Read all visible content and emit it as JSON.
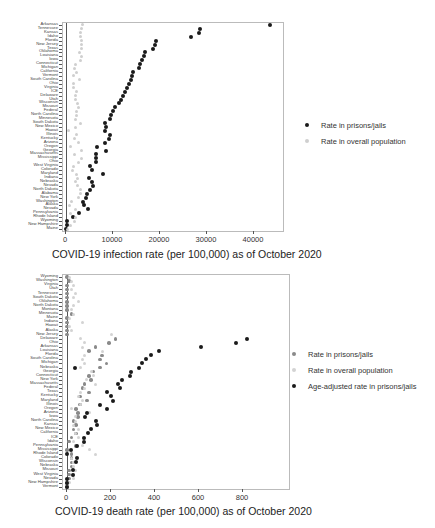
{
  "chart_data": [
    {
      "type": "scatter",
      "title": "",
      "xlabel": "COVID-19 infection rate (per 100,000) as of October 2020",
      "ylabel": "",
      "xlim": [
        0,
        45000
      ],
      "xticks": [
        0,
        10000,
        20000,
        30000,
        40000
      ],
      "grid": false,
      "legend_position": "right",
      "legend": [
        "Rate in prisons/jails",
        "Rate in overall population"
      ],
      "categories": [
        "Arkansas",
        "Tennessee",
        "Kansas",
        "Idaho",
        "Florida",
        "New Jersey",
        "Texas",
        "Oklahoma",
        "Louisiana",
        "Iowa",
        "Connecticut",
        "Michigan",
        "California",
        "Vermont",
        "South Carolina",
        "Ohio",
        "Virginia",
        "ICE",
        "Delaware",
        "Utah",
        "Wisconsin",
        "Missouri",
        "Federal",
        "North Carolina",
        "Minnesota",
        "South Dakota",
        "New Mexico",
        "Hawaii",
        "Illinois",
        "Kentucky",
        "Arizona",
        "Oregon",
        "Georgia",
        "Massachusetts",
        "Mississippi",
        "Ohio",
        "West Virginia",
        "Colorado",
        "Maryland",
        "Indiana",
        "Nebraska",
        "Nevada",
        "North Dakota",
        "Alabama",
        "New York",
        "Washington",
        "Alaska",
        "Nevada",
        "Pennsylvania",
        "Rhode Island",
        "Wyoming",
        "New Hampshire",
        "Maine"
      ],
      "series": [
        {
          "name": "Rate in prisons/jails",
          "color": "#1a1a1a",
          "values": [
            43500,
            28500,
            28300,
            26500,
            19100,
            19000,
            18500,
            16800,
            16500,
            16200,
            15800,
            15500,
            14300,
            14000,
            13800,
            13300,
            13000,
            12600,
            12200,
            11800,
            11300,
            10400,
            10100,
            9600,
            9300,
            8200,
            8600,
            8300,
            9400,
            9100,
            8400,
            6700,
            8500,
            6400,
            6300,
            6400,
            5000,
            5600,
            7800,
            4900,
            5500,
            5800,
            5200,
            4500,
            4300,
            3700,
            3800,
            4600,
            2800,
            1400,
            200,
            200,
            100
          ]
        },
        {
          "name": "Rate in overall population",
          "color": "#cfcfcf",
          "values": [
            3600,
            3400,
            3000,
            3100,
            3400,
            3200,
            3300,
            2800,
            3300,
            3000,
            2000,
            1800,
            2200,
            1500,
            2900,
            1500,
            1500,
            2300,
            2100,
            2100,
            2500,
            2600,
            2200,
            2300,
            2000,
            3000,
            2000,
            500,
            2300,
            1800,
            2700,
            1000,
            3200,
            1900,
            3300,
            2700,
            1700,
            1400,
            2200,
            2400,
            2000,
            2400,
            3000,
            3100,
            2700,
            1100,
            800,
            2000,
            1000,
            2000,
            1800,
            1000,
            300
          ]
        }
      ]
    },
    {
      "type": "scatter",
      "title": "",
      "xlabel": "COVID-19 death rate (per 100,000) as of October 2020",
      "ylabel": "",
      "xlim": [
        0,
        850
      ],
      "xticks": [
        0,
        200,
        400,
        600,
        800
      ],
      "grid": false,
      "legend_position": "right",
      "legend": [
        "Rate in prisons/jails",
        "Rate in overall population",
        "Age-adjusted rate in prisons/jails"
      ],
      "categories": [
        "Wyoming",
        "Washington",
        "Virginia",
        "Utah",
        "Tennessee",
        "South Dakota",
        "Oklahoma",
        "North Dakota",
        "Montana",
        "Minnesota",
        "Maine",
        "Indiana",
        "Hawaii",
        "Alaska",
        "New Jersey",
        "Delaware",
        "Ohio",
        "Arkansas",
        "Louisiana",
        "Florida",
        "South Carolina",
        "Michigan",
        "Nebraska",
        "Georgia",
        "Connecticut",
        "New York",
        "Massachusetts",
        "Federal",
        "Texas",
        "Kentucky",
        "Maryland",
        "Illinois",
        "Oregon",
        "Arizona",
        "Iowa",
        "North Carolina",
        "Kansas",
        "New Mexico",
        "California",
        "ICE",
        "Idaho",
        "Pennsylvania",
        "Mississippi",
        "Rhode Island",
        "Colorado",
        "Wisconsin",
        "Nebraska",
        "Missouri",
        "West Virginia",
        "Nevada",
        "New Hampshire",
        "Vermont"
      ],
      "series": [
        {
          "name": "Rate in prisons/jails",
          "color": "#8a8a8a",
          "values": [
            0,
            10,
            0,
            0,
            0,
            0,
            0,
            0,
            0,
            20,
            0,
            0,
            0,
            0,
            0,
            220,
            190,
            130,
            100,
            160,
            150,
            180,
            150,
            120,
            100,
            110,
            80,
            70,
            100,
            60,
            90,
            60,
            40,
            50,
            50,
            30,
            40,
            30,
            40,
            20,
            10,
            40,
            0,
            20,
            20,
            20,
            20,
            10,
            10,
            10,
            0,
            0
          ]
        },
        {
          "name": "Rate in overall population",
          "color": "#d3d3d3",
          "values": [
            10,
            20,
            30,
            20,
            40,
            30,
            50,
            30,
            20,
            30,
            10,
            70,
            10,
            20,
            200,
            60,
            80,
            70,
            160,
            80,
            70,
            80,
            60,
            110,
            120,
            90,
            130,
            80,
            60,
            50,
            70,
            60,
            20,
            100,
            40,
            40,
            30,
            50,
            40,
            50,
            30,
            70,
            100,
            130,
            20,
            30,
            30,
            40,
            30,
            30,
            10,
            0
          ]
        },
        {
          "name": "Age-adjusted rate in prisons/jails",
          "color": "#1a1a1a",
          "values": [
            null,
            null,
            null,
            null,
            null,
            null,
            null,
            null,
            null,
            null,
            null,
            null,
            null,
            null,
            null,
            null,
            null,
            null,
            null,
            null,
            null,
            null,
            null,
            null,
            null,
            null,
            null,
            null,
            null,
            null,
            null,
            null,
            null,
            null,
            null,
            null,
            null,
            null,
            null,
            null,
            null,
            null,
            null,
            null,
            null,
            null,
            null,
            null,
            null,
            null,
            null,
            null
          ]
        }
      ],
      "age_adjusted_points": [
        {
          "category": "Delaware",
          "value": 820
        },
        {
          "category": "Ohio",
          "value": 770
        },
        {
          "category": "Arkansas",
          "value": 610
        },
        {
          "category": "Louisiana",
          "value": 420
        },
        {
          "category": "Florida",
          "value": 380
        },
        {
          "category": "South Carolina",
          "value": 360
        },
        {
          "category": "Michigan",
          "value": 340
        },
        {
          "category": "Nebraska",
          "value": 325
        },
        {
          "category": "Georgia",
          "value": 290
        },
        {
          "category": "Connecticut",
          "value": 285
        },
        {
          "category": "New York",
          "value": 250
        },
        {
          "category": "Massachusetts",
          "value": 230
        },
        {
          "category": "Federal",
          "value": 240
        },
        {
          "category": "Texas",
          "value": 180
        },
        {
          "category": "Kentucky",
          "value": 200
        },
        {
          "category": "Maryland",
          "value": 210
        },
        {
          "category": "Illinois",
          "value": 150
        },
        {
          "category": "Oregon",
          "value": 180
        },
        {
          "category": "Arizona",
          "value": 90
        },
        {
          "category": "Iowa",
          "value": 80
        },
        {
          "category": "North Carolina",
          "value": 130
        },
        {
          "category": "Kansas",
          "value": 135
        },
        {
          "category": "New Mexico",
          "value": 110
        },
        {
          "category": "California",
          "value": 95
        },
        {
          "category": "ICE",
          "value": 75
        },
        {
          "category": "Idaho",
          "value": 75
        },
        {
          "category": "Pennsylvania",
          "value": 45
        },
        {
          "category": "Mississippi",
          "value": 20
        },
        {
          "category": "Rhode Island",
          "value": 0
        },
        {
          "category": "Colorado",
          "value": 45
        },
        {
          "category": "Wisconsin",
          "value": 40
        },
        {
          "category": "Nebraska",
          "value": 35
        },
        {
          "category": "Missouri",
          "value": 25
        },
        {
          "category": "West Virginia",
          "value": 25
        },
        {
          "category": "Nevada",
          "value": 0
        },
        {
          "category": "New Hampshire",
          "value": 0
        },
        {
          "category": "Vermont",
          "value": 0
        }
      ]
    }
  ]
}
